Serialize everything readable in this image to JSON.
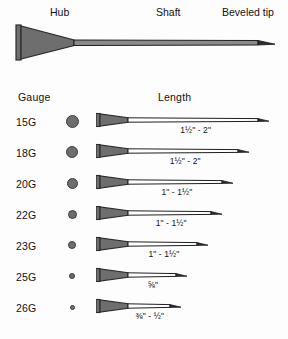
{
  "diagram": {
    "title_parts": {
      "hub": "Hub",
      "shaft": "Shaft",
      "beveled_tip": "Beveled tip"
    },
    "colors": {
      "hub_fill": "#6e6e6e",
      "hub_stroke": "#2b2b2b",
      "shaft_fill": "#8a8a8a",
      "shaft_stroke": "#1f1f1f",
      "dot_fill": "#6e6e6e",
      "dot_stroke": "#3d3d3d",
      "background": "#fdfdfd",
      "text": "#111111"
    }
  },
  "table": {
    "headers": {
      "gauge": "Gauge",
      "length": "Length"
    },
    "rows": [
      {
        "gauge": "15G",
        "dot_diameter": 13,
        "needle_length_px": 162,
        "length_label": "1½\" - 2\"",
        "length_min_in": 1.5,
        "length_max_in": 2.0
      },
      {
        "gauge": "18G",
        "dot_diameter": 12,
        "needle_length_px": 142,
        "length_label": "1½\" - 2\"",
        "length_min_in": 1.5,
        "length_max_in": 2.0
      },
      {
        "gauge": "20G",
        "dot_diameter": 11,
        "needle_length_px": 126,
        "length_label": "1\" - 1½\"",
        "length_min_in": 1.0,
        "length_max_in": 1.5
      },
      {
        "gauge": "22G",
        "dot_diameter": 9,
        "needle_length_px": 115,
        "length_label": "1\" - 1½\"",
        "length_min_in": 1.0,
        "length_max_in": 1.5
      },
      {
        "gauge": "23G",
        "dot_diameter": 8,
        "needle_length_px": 101,
        "length_label": "1\" - 1½\"",
        "length_min_in": 1.0,
        "length_max_in": 1.5
      },
      {
        "gauge": "25G",
        "dot_diameter": 6,
        "needle_length_px": 80,
        "length_label": "⅝\"",
        "length_min_in": 0.625,
        "length_max_in": 0.625
      },
      {
        "gauge": "26G",
        "dot_diameter": 5,
        "needle_length_px": 74,
        "length_label": "⅜\" - ½\"",
        "length_min_in": 0.375,
        "length_max_in": 0.5
      }
    ]
  }
}
